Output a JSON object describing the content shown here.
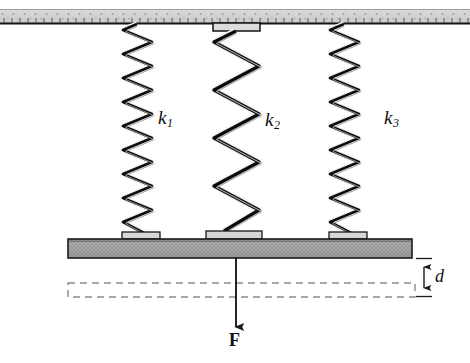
{
  "figure": {
    "background_color": "#ffffff"
  },
  "ceiling": {
    "name": "fixed-support-ceiling",
    "fill_color": "#d2d2d2",
    "edge_color": "#1a1a1a",
    "x": 0,
    "y": 9,
    "width": 470,
    "height": 15,
    "texture": "speckled-hatch"
  },
  "springs": [
    {
      "id": "spring-1",
      "label": "k",
      "subscript": "1",
      "label_x": 158,
      "label_y": 116,
      "center_x": 137,
      "top_y": 24,
      "bottom_y": 238,
      "coils": 17,
      "amplitude": 15,
      "stroke_color": "#111111",
      "has_top_plate": false
    },
    {
      "id": "spring-2",
      "label": "k",
      "subscript": "2",
      "label_x": 265,
      "label_y": 118,
      "center_x": 236,
      "top_y": 24,
      "bottom_y": 238,
      "coils": 9,
      "amplitude": 22,
      "stroke_color": "#111111",
      "has_top_plate": true
    },
    {
      "id": "spring-3",
      "label": "k",
      "subscript": "3",
      "label_x": 384,
      "label_y": 116,
      "center_x": 344,
      "top_y": 24,
      "bottom_y": 238,
      "coils": 17,
      "amplitude": 15,
      "stroke_color": "#111111",
      "has_top_plate": false
    }
  ],
  "bar": {
    "name": "rigid-bar",
    "fill_color": "#a8a8a8",
    "edge_color": "#1c1c1c",
    "x": 68,
    "y": 239,
    "width": 344,
    "height": 19,
    "texture": "cross-hatch"
  },
  "dimension": {
    "name": "displacement-d",
    "label": "d",
    "x": 424,
    "top_y": 258,
    "bottom_y": 296,
    "tick_half_width": 8,
    "color": "#1a1a1a"
  },
  "force": {
    "name": "applied-force-F",
    "label": "F",
    "x": 236,
    "start_y": 258,
    "end_y": 327,
    "label_x": 229,
    "label_y": 332,
    "color": "#1a1a1a"
  },
  "dashed_outline": {
    "name": "undeformed-reference-outline",
    "x": 68,
    "y": 283,
    "width": 347,
    "height": 14,
    "color": "#8a8a8a",
    "dash": "7,5"
  }
}
